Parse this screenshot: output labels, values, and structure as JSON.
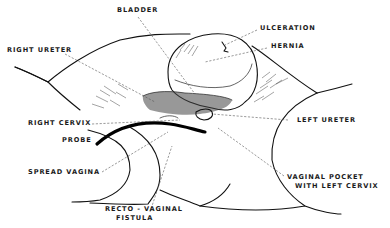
{
  "figure": {
    "type": "anatomical-line-drawing",
    "labels": {
      "bladder": "BLADDER",
      "ulceration": "ULCERATION",
      "hernia": "HERNIA",
      "right_ureter": "RIGHT URETER",
      "left_ureter": "LEFT URETER",
      "right_cervix": "RIGHT CERVIX",
      "probe": "PROBE",
      "spread_vagina": "SPREAD VAGINA",
      "vaginal_pocket_line1": "VAGINAL POCKET",
      "vaginal_pocket_line2": "WITH LEFT CERVIX",
      "recto_vaginal_line1": "RECTO - VAGINAL",
      "recto_vaginal_line2": "FISTULA"
    },
    "colors": {
      "ink": "#111111",
      "leader": "#555555",
      "background": "#ffffff"
    }
  }
}
